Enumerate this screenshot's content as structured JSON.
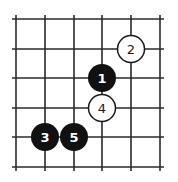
{
  "diagram": {
    "type": "go-board-fragment",
    "grid": {
      "columns": 6,
      "rows": 6,
      "x_lines": [
        16,
        45,
        74,
        102,
        131,
        160
      ],
      "y_lines": [
        19,
        49,
        78,
        108,
        137,
        167
      ],
      "line_color": "#2a2a2a"
    },
    "stones": [
      {
        "move": "1",
        "color": "black",
        "col": 3,
        "row": 2
      },
      {
        "move": "2",
        "color": "white",
        "col": 4,
        "row": 1
      },
      {
        "move": "3",
        "color": "black",
        "col": 1,
        "row": 4
      },
      {
        "move": "4",
        "color": "white",
        "col": 3,
        "row": 3
      },
      {
        "move": "5",
        "color": "black",
        "col": 2,
        "row": 4
      }
    ],
    "colors": {
      "black_stone": "#111111",
      "white_stone": "#ffffff",
      "stone_outline": "#1a1a1a"
    }
  }
}
